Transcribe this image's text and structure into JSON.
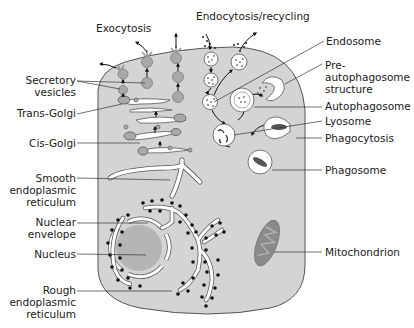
{
  "labels": {
    "exocytosis": "Exocytosis",
    "endocytosis": "Endocytosis/recycling",
    "secretory_vesicles_1": "Secretory",
    "secretory_vesicles_2": "vesicles",
    "trans_golgi": "Trans-Golgi",
    "cis_golgi": "Cis-Golgi",
    "smooth_er_1": "Smooth",
    "smooth_er_2": "endoplasmic",
    "smooth_er_3": "reticulum",
    "nuclear_envelope_1": "Nuclear",
    "nuclear_envelope_2": "envelope",
    "nucleus": "Nucleus",
    "rough_er_1": "Rough",
    "rough_er_2": "endoplasmic",
    "rough_er_3": "reticulum",
    "endosome": "Endosome",
    "pre_autophagosome_1": "Pre-",
    "pre_autophagosome_2": "autophagosome",
    "pre_autophagosome_3": "structure",
    "autophagosome": "Autophagosome",
    "lysosome": "Lyosome",
    "phagocytosis": "Phagocytosis",
    "phagosome": "Phagosome",
    "mitochondrion": "Mitochondrion"
  },
  "colors": {
    "cytoplasm": "#d4d4d4",
    "organelle": "#a9a9a9",
    "outline": "#4a4a4a",
    "membrane_white": "#ffffff",
    "ribosome": "#111111"
  }
}
